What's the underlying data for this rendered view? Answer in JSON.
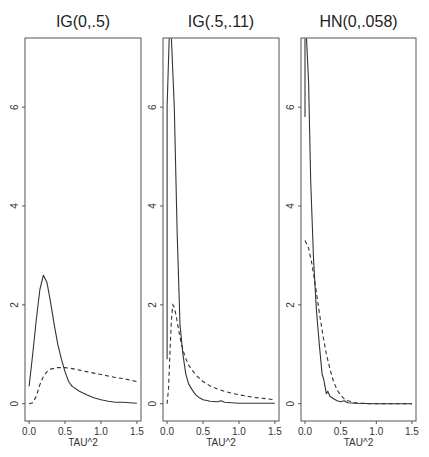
{
  "chart_data": [
    {
      "type": "line",
      "title": "IG(0,.5)",
      "xlabel": "TAU^2",
      "ylabel": "",
      "xlim": [
        0.0,
        1.5
      ],
      "ylim": [
        -0.35,
        7.4
      ],
      "xticks": [
        "0.0",
        "0.5",
        "1.0",
        "1.5"
      ],
      "yticks": [
        "0",
        "2",
        "4",
        "6"
      ],
      "grid": false,
      "series": [
        {
          "name": "posterior",
          "style": "solid",
          "x": [
            0.0,
            0.05,
            0.1,
            0.15,
            0.2,
            0.25,
            0.3,
            0.35,
            0.4,
            0.45,
            0.5,
            0.55,
            0.6,
            0.7,
            0.8,
            0.9,
            1.0,
            1.1,
            1.2,
            1.3,
            1.4,
            1.5
          ],
          "y": [
            0.35,
            1.0,
            1.7,
            2.3,
            2.6,
            2.45,
            2.05,
            1.6,
            1.2,
            0.9,
            0.65,
            0.45,
            0.35,
            0.25,
            0.18,
            0.12,
            0.08,
            0.05,
            0.03,
            0.03,
            0.02,
            0.01
          ]
        },
        {
          "name": "prior",
          "style": "dashed",
          "x": [
            0.0,
            0.05,
            0.1,
            0.15,
            0.2,
            0.25,
            0.3,
            0.4,
            0.5,
            0.6,
            0.7,
            0.8,
            0.9,
            1.0,
            1.1,
            1.2,
            1.3,
            1.4,
            1.5
          ],
          "y": [
            0.0,
            0.02,
            0.15,
            0.38,
            0.55,
            0.65,
            0.7,
            0.73,
            0.73,
            0.71,
            0.68,
            0.65,
            0.62,
            0.59,
            0.56,
            0.53,
            0.51,
            0.48,
            0.45
          ]
        }
      ]
    },
    {
      "type": "line",
      "title": "IG(.5,.11)",
      "xlabel": "TAU^2",
      "ylabel": "",
      "xlim": [
        0.0,
        1.5
      ],
      "ylim": [
        -0.35,
        7.4
      ],
      "xticks": [
        "0.0",
        "0.5",
        "1.0",
        "1.5"
      ],
      "yticks": [
        "0",
        "2",
        "4",
        "6"
      ],
      "grid": false,
      "series": [
        {
          "name": "posterior",
          "style": "solid",
          "x": [
            0.0,
            0.0,
            0.03,
            0.06,
            0.1,
            0.14,
            0.18,
            0.22,
            0.26,
            0.3,
            0.35,
            0.4,
            0.45,
            0.5,
            0.6,
            0.7,
            0.75,
            0.8,
            0.9,
            1.0,
            1.2,
            1.5
          ],
          "y": [
            0.9,
            6.0,
            7.4,
            7.4,
            6.0,
            3.5,
            1.6,
            1.0,
            0.6,
            0.4,
            0.28,
            0.18,
            0.12,
            0.08,
            0.05,
            0.04,
            0.06,
            0.03,
            0.02,
            0.01,
            0.01,
            0.01
          ]
        },
        {
          "name": "prior",
          "style": "dashed",
          "x": [
            0.0,
            0.02,
            0.04,
            0.06,
            0.08,
            0.1,
            0.13,
            0.16,
            0.2,
            0.25,
            0.3,
            0.4,
            0.5,
            0.6,
            0.7,
            0.8,
            0.9,
            1.0,
            1.2,
            1.5
          ],
          "y": [
            0.0,
            0.3,
            1.0,
            1.7,
            2.0,
            1.95,
            1.75,
            1.5,
            1.2,
            0.95,
            0.78,
            0.58,
            0.45,
            0.36,
            0.3,
            0.25,
            0.21,
            0.18,
            0.13,
            0.08
          ]
        }
      ]
    },
    {
      "type": "line",
      "title": "HN(0,.058)",
      "xlabel": "TAU^2",
      "ylabel": "",
      "xlim": [
        0.0,
        1.5
      ],
      "ylim": [
        -0.35,
        7.4
      ],
      "xticks": [
        "0.0",
        "0.5",
        "1.0",
        "1.5"
      ],
      "yticks": [
        "0",
        "2",
        "4",
        "6"
      ],
      "grid": false,
      "series": [
        {
          "name": "posterior",
          "style": "solid",
          "x": [
            0.0,
            0.0,
            0.02,
            0.05,
            0.08,
            0.12,
            0.16,
            0.2,
            0.24,
            0.26,
            0.28,
            0.3,
            0.32,
            0.35,
            0.4,
            0.45,
            0.5,
            0.55,
            0.6,
            0.7,
            1.0,
            1.5
          ],
          "y": [
            5.8,
            7.4,
            7.4,
            6.5,
            4.5,
            2.9,
            1.9,
            1.2,
            0.6,
            0.5,
            0.35,
            0.2,
            0.25,
            0.15,
            0.1,
            0.06,
            0.04,
            0.06,
            0.02,
            0.01,
            0.0,
            0.0
          ]
        },
        {
          "name": "prior",
          "style": "dashed",
          "x": [
            0.0,
            0.05,
            0.1,
            0.15,
            0.2,
            0.25,
            0.3,
            0.35,
            0.4,
            0.45,
            0.5,
            0.55,
            0.6,
            0.7,
            0.8,
            0.9,
            1.0,
            1.5
          ],
          "y": [
            3.3,
            3.15,
            2.8,
            2.35,
            1.85,
            1.4,
            1.0,
            0.7,
            0.45,
            0.28,
            0.17,
            0.1,
            0.06,
            0.02,
            0.01,
            0.0,
            0.0,
            0.0
          ]
        }
      ]
    }
  ]
}
